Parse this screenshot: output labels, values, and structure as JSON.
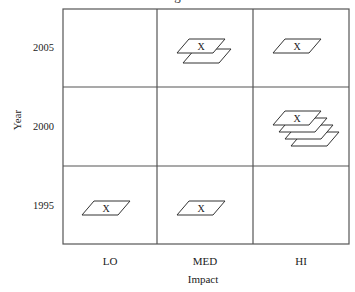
{
  "diagram": {
    "title_fragment": "g",
    "y_axis": {
      "label": "Year",
      "ticks": [
        "2005",
        "2000",
        "1995"
      ]
    },
    "x_axis": {
      "label": "Impact",
      "ticks": [
        "LO",
        "MED",
        "HI"
      ]
    },
    "marker_label": "X",
    "cells": [
      {
        "year": "2005",
        "impact": "LO",
        "count": 0
      },
      {
        "year": "2005",
        "impact": "MED",
        "count": 2
      },
      {
        "year": "2005",
        "impact": "HI",
        "count": 1
      },
      {
        "year": "2000",
        "impact": "LO",
        "count": 0
      },
      {
        "year": "2000",
        "impact": "MED",
        "count": 0
      },
      {
        "year": "2000",
        "impact": "HI",
        "count": 4
      },
      {
        "year": "1995",
        "impact": "LO",
        "count": 1
      },
      {
        "year": "1995",
        "impact": "MED",
        "count": 1
      },
      {
        "year": "1995",
        "impact": "HI",
        "count": 0
      }
    ],
    "colors": {
      "grid": "#555555",
      "shape_stroke": "#333333",
      "background": "#ffffff"
    }
  }
}
